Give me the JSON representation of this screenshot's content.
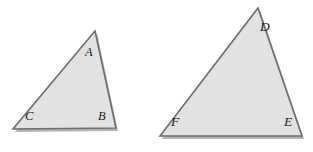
{
  "figure": {
    "type": "geometry-diagram",
    "background_color": "#ffffff",
    "canvas": {
      "width": 313,
      "height": 152
    },
    "style": {
      "fill_color": "#e2e2e2",
      "stroke_color": "#6e6e6e",
      "stroke_width": 1.6,
      "shadow_color": "#9a9a9a",
      "label_color": "#1c1c1c"
    },
    "shapes": [
      {
        "name": "triangle-abc",
        "label": "Triangle ABC",
        "points": "95,31 116,128 13,129",
        "vertices": [
          {
            "id": "A",
            "label": "A",
            "x": 95,
            "y": 31,
            "label_x": 85,
            "label_y": 46
          },
          {
            "id": "B",
            "label": "B",
            "x": 116,
            "y": 128,
            "label_x": 98,
            "label_y": 110
          },
          {
            "id": "C",
            "label": "C",
            "x": 13,
            "y": 129,
            "label_x": 25,
            "label_y": 110
          }
        ]
      },
      {
        "name": "triangle-def",
        "label": "Triangle DEF",
        "points": "258,8 302,136 160,136",
        "vertices": [
          {
            "id": "D",
            "label": "D",
            "x": 258,
            "y": 8,
            "label_x": 260,
            "label_y": 20
          },
          {
            "id": "E",
            "label": "E",
            "x": 302,
            "y": 136,
            "label_x": 284,
            "label_y": 115
          },
          {
            "id": "F",
            "label": "F",
            "x": 160,
            "y": 136,
            "label_x": 171,
            "label_y": 115
          }
        ]
      }
    ]
  }
}
